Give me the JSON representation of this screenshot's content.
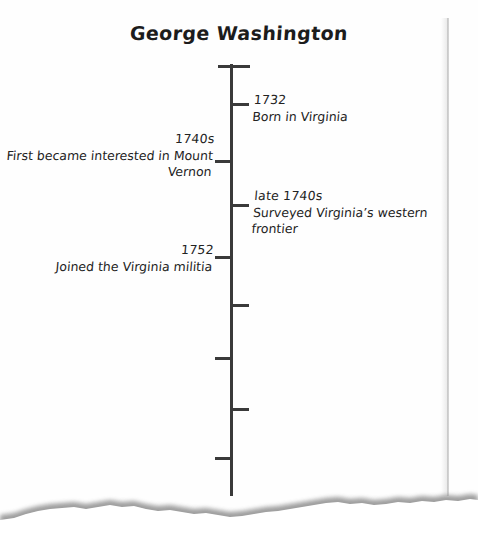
{
  "document": {
    "title": "George Washington",
    "type": "hand-drawn vertical timeline on torn paper"
  },
  "timeline": {
    "axis": {
      "orientation": "vertical",
      "top_cap_tick": true,
      "color": "#3a3a3a"
    },
    "events": [
      {
        "id": "born",
        "year": "1732",
        "description": "Born in Virginia",
        "side": "right",
        "tick_y": 103
      },
      {
        "id": "mount-vernon",
        "year": "1740s",
        "description": "First became interested in Mount Vernon",
        "side": "left",
        "tick_y": 160
      },
      {
        "id": "surveying",
        "year": "late 1740s",
        "description": "Surveyed Virginia’s western frontier",
        "side": "right",
        "tick_y": 204
      },
      {
        "id": "militia",
        "year": "1752",
        "description": "Joined the Virginia militia",
        "side": "left",
        "tick_y": 256
      }
    ],
    "unlabeled_ticks": [
      {
        "side": "right",
        "tick_y": 304
      },
      {
        "side": "left",
        "tick_y": 357
      },
      {
        "side": "right",
        "tick_y": 408
      },
      {
        "side": "left",
        "tick_y": 457
      }
    ]
  },
  "colors": {
    "ink": "#232323",
    "axis": "#3a3a3a",
    "paper": "#fefefe",
    "torn_shadow": "#9a9a9a"
  }
}
